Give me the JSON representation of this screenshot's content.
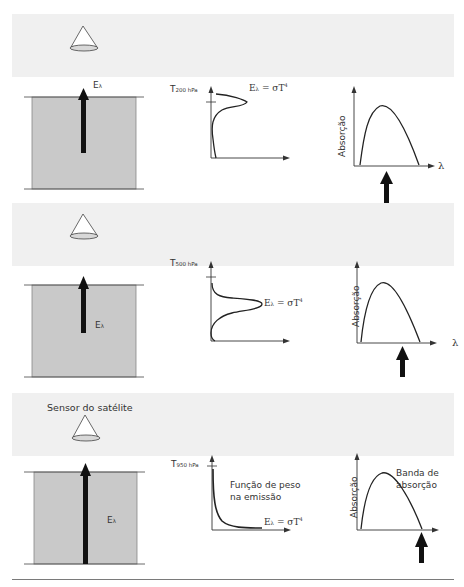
{
  "figure": {
    "panels": [
      {
        "id": "panel-200hpa",
        "atmosphere_arrow_label": "E",
        "atmosphere_arrow_sub": "λ",
        "weighting_level_label": "T",
        "weighting_level_sub": "200 hPa",
        "equation_label": "E",
        "equation_sub": "λ",
        "equation_rest": " = σT",
        "equation_sup": "4",
        "absorption_ylabel": "Absorção",
        "absorption_xlabel": "λ",
        "sensor_label": "",
        "weighting_note": "",
        "band_note": ""
      },
      {
        "id": "panel-500hpa",
        "atmosphere_arrow_label": "E",
        "atmosphere_arrow_sub": "λ",
        "weighting_level_label": "T",
        "weighting_level_sub": "500 hPa",
        "equation_label": "E",
        "equation_sub": "λ",
        "equation_rest": " = σT",
        "equation_sup": "4",
        "absorption_ylabel": "Absorção",
        "absorption_xlabel": "λ",
        "sensor_label": "",
        "weighting_note": "",
        "band_note": ""
      },
      {
        "id": "panel-950hpa",
        "atmosphere_arrow_label": "E",
        "atmosphere_arrow_sub": "λ",
        "weighting_level_label": "T",
        "weighting_level_sub": "950 hPa",
        "equation_label": "E",
        "equation_sub": "λ",
        "equation_rest": " = σT",
        "equation_sup": "4",
        "absorption_ylabel": "Absorção",
        "absorption_xlabel": "",
        "sensor_label": "Sensor do satélite",
        "weighting_note_line1": "Função de peso",
        "weighting_note_line2": "na emissão",
        "band_note_line1": "Banda de",
        "band_note_line2": "absorção"
      }
    ],
    "colors": {
      "sky_band": "#f0f0f0",
      "atmosphere_fill": "#c9c9c9",
      "line": "#222222",
      "arrow": "#111111"
    }
  }
}
